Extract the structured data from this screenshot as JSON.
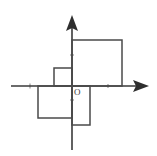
{
  "figure": {
    "origin_label": "O",
    "background_color": "#ffffff",
    "axis_color": "#3a3a3a",
    "shape_stroke_color": "#4a4a4a",
    "tick_color": "#8d8d8d",
    "canvas": {
      "width": 157,
      "height": 156
    }
  },
  "axes": {
    "origin": {
      "x": 72,
      "y": 86
    },
    "x_axis": {
      "name": "x-axis",
      "start": {
        "x": 11,
        "y": 86
      },
      "end": {
        "x": 137,
        "y": 86
      },
      "arrow_tip": {
        "x": 149,
        "y": 86
      },
      "direction": "right"
    },
    "y_axis": {
      "name": "y-axis",
      "start": {
        "x": 72,
        "y": 150
      },
      "end": {
        "x": 72,
        "y": 27
      },
      "arrow_tip": {
        "x": 72,
        "y": 15
      },
      "direction": "up"
    },
    "ticks": [
      {
        "axis": "x",
        "x": 30,
        "y": 86,
        "length": 5
      },
      {
        "axis": "x",
        "x": 108,
        "y": 86,
        "length": 4
      },
      {
        "axis": "y",
        "x": 72,
        "y": 55,
        "length": 4
      },
      {
        "axis": "y",
        "x": 72,
        "y": 100,
        "length": 4
      }
    ]
  },
  "shapes": [
    {
      "name": "large-square-quadrant-1",
      "quadrant": "I",
      "x": 72,
      "y": 40,
      "width": 50,
      "height": 46,
      "description": "Large square in the upper-right, sitting on the x-axis with its left side on the y-axis"
    },
    {
      "name": "small-square-quadrant-2",
      "quadrant": "II",
      "x": 54,
      "y": 68,
      "width": 18,
      "height": 18,
      "description": "Small square in the upper-left, resting on the x-axis with its right side on the y-axis"
    },
    {
      "name": "medium-square-quadrant-3",
      "quadrant": "III",
      "x": 38,
      "y": 86,
      "width": 34,
      "height": 32,
      "description": "Medium square in the lower-left, hanging from the x-axis with its right side on the y-axis"
    },
    {
      "name": "narrow-rectangle-quadrant-4",
      "quadrant": "IV",
      "x": 72,
      "y": 86,
      "width": 18,
      "height": 39,
      "description": "Tall narrow rectangle in the lower-right, hanging from the x-axis with its left side on the y-axis"
    }
  ],
  "labels": [
    {
      "name": "origin-label",
      "text": "O",
      "x": 74,
      "y": 88
    }
  ]
}
